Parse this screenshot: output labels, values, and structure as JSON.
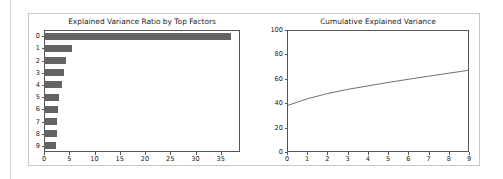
{
  "figure": {
    "background_color": "#ffffff",
    "panel_border_color": "#c8c8c8",
    "axis_color": "#555555",
    "bar_color": "#636363",
    "line_color": "#4d4d4d"
  },
  "chart_data": [
    {
      "type": "bar",
      "orientation": "horizontal",
      "title": "Explained Variance Ratio by Top Factors",
      "xlabel": "",
      "ylabel": "",
      "categories": [
        "0",
        "1",
        "2",
        "3",
        "4",
        "5",
        "6",
        "7",
        "8",
        "9"
      ],
      "values": [
        37.0,
        5.6,
        4.3,
        4.0,
        3.5,
        3.0,
        2.8,
        2.6,
        2.6,
        2.4
      ],
      "xlim": [
        0,
        38.8
      ],
      "ylim_categories": 10,
      "xticks": [
        0,
        5,
        10,
        15,
        20,
        25,
        30,
        35
      ],
      "xtick_labels": [
        "0",
        "5",
        "10",
        "15",
        "20",
        "25",
        "30",
        "35"
      ],
      "ytick_labels": [
        "0",
        "1",
        "2",
        "3",
        "4",
        "5",
        "6",
        "7",
        "8",
        "9"
      ],
      "grid": false,
      "legend": null,
      "series_color": "#636363"
    },
    {
      "type": "line",
      "title": "Cumulative Explained Variance",
      "xlabel": "",
      "ylabel": "",
      "x": [
        0,
        1,
        2,
        3,
        4,
        5,
        6,
        7,
        8,
        9
      ],
      "values": [
        38.0,
        43.6,
        47.9,
        51.3,
        54.2,
        57.0,
        59.6,
        62.1,
        64.6,
        67.0
      ],
      "xlim": [
        0,
        9
      ],
      "ylim": [
        0,
        100
      ],
      "xticks": [
        0,
        1,
        2,
        3,
        4,
        5,
        6,
        7,
        8,
        9
      ],
      "xtick_labels": [
        "0",
        "1",
        "2",
        "3",
        "4",
        "5",
        "6",
        "7",
        "8",
        "9"
      ],
      "yticks": [
        0,
        20,
        40,
        60,
        80,
        100
      ],
      "ytick_labels": [
        "0",
        "20",
        "40",
        "60",
        "80",
        "100"
      ],
      "grid": false,
      "legend": null,
      "series_color": "#4d4d4d"
    }
  ]
}
